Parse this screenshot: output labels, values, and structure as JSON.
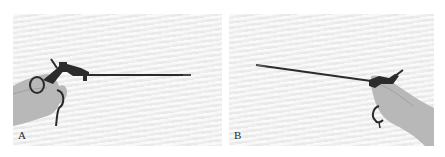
{
  "figure": {
    "panels": [
      {
        "id": "A",
        "label": "A",
        "subject": "laparoscopic instrument held in right hand, shaft pointing right"
      },
      {
        "id": "B",
        "label": "B",
        "subject": "laparoscopic instrument held in right hand, shaft pointing left"
      }
    ],
    "colors": {
      "background": "#efefef",
      "instrument": "#2b2b2b",
      "skin": "#b4b4b4",
      "label": "#2a2a2a"
    }
  }
}
